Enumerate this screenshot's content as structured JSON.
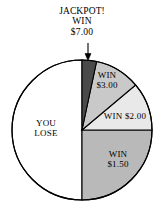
{
  "chart_data": {
    "type": "pie",
    "title": "",
    "subtitle": "",
    "xlabel": "",
    "ylabel": "",
    "legend_position": "none",
    "grid": false,
    "total_degrees": 360,
    "center": {
      "x": 82,
      "y": 130
    },
    "radius": 70,
    "categories": [
      "JACKPOT! WIN $7.00",
      "WIN $3.00",
      "WIN $2.00",
      "WIN $1.50",
      "YOU LOSE"
    ],
    "values": [
      12,
      38,
      40,
      90,
      180
    ],
    "value_unit": "degrees",
    "percentages": [
      3.3,
      10.6,
      11.1,
      25.0,
      50.0
    ],
    "slices": [
      {
        "id": "jackpot",
        "label": "JACKPOT! WIN $7.00",
        "label_lines": [
          "JACKPOT!",
          "WIN",
          "$7.00"
        ],
        "payout": "$7.00",
        "start_deg": 0,
        "end_deg": 12,
        "sweep_deg": 12,
        "percent": 3.3,
        "color": "#4a4a4a",
        "label_placement": "outside-callout"
      },
      {
        "id": "win3",
        "label": "WIN $3.00",
        "label_lines": [
          "WIN",
          "$3.00"
        ],
        "payout": "$3.00",
        "start_deg": 12,
        "end_deg": 50,
        "sweep_deg": 38,
        "percent": 10.6,
        "color": "#c9c9c9",
        "label_placement": "inside"
      },
      {
        "id": "win2",
        "label": "WIN $2.00",
        "label_lines": [
          "WIN $2.00"
        ],
        "payout": "$2.00",
        "start_deg": 50,
        "end_deg": 90,
        "sweep_deg": 40,
        "percent": 11.1,
        "color": "#e9e9e9",
        "label_placement": "inside"
      },
      {
        "id": "win150",
        "label": "WIN $1.50",
        "label_lines": [
          "WIN",
          "$1.50"
        ],
        "payout": "$1.50",
        "start_deg": 90,
        "end_deg": 180,
        "sweep_deg": 90,
        "percent": 25.0,
        "color": "#b9b9b9",
        "label_placement": "inside"
      },
      {
        "id": "lose",
        "label": "YOU LOSE",
        "label_lines": [
          "YOU",
          "LOSE"
        ],
        "payout": "$0.00",
        "start_deg": 180,
        "end_deg": 360,
        "sweep_deg": 180,
        "percent": 50.0,
        "color": "#ffffff",
        "label_placement": "inside"
      }
    ],
    "stroke_color": "#000000",
    "background": "#ffffff"
  },
  "callouts": {
    "jackpot": {
      "line1": "JACKPOT!",
      "line2": "WIN",
      "line3": "$7.00",
      "arrow": "down-arrow-icon"
    }
  },
  "labels": {
    "lose_line1": "YOU",
    "lose_line2": "LOSE",
    "win3_line1": "WIN",
    "win3_line2": "$3.00",
    "win2_line1": "WIN $2.00",
    "win150_line1": "WIN",
    "win150_line2": "$1.50"
  }
}
